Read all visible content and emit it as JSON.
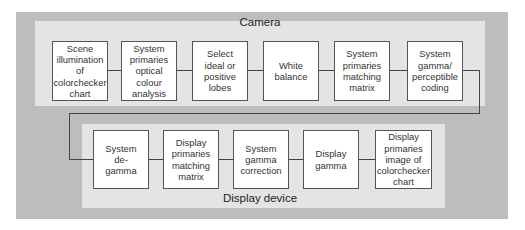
{
  "diagram": {
    "camera": {
      "title": "Camera",
      "boxes": [
        {
          "label": "Scene\nillumination\nof\ncolorchecker\nchart"
        },
        {
          "label": "System\nprimaries\noptical\ncolour\nanalysis"
        },
        {
          "label": "Select\nideal or\npositive\nlobes"
        },
        {
          "label": "White\nbalance"
        },
        {
          "label": "System\nprimaries\nmatching\nmatrix"
        },
        {
          "label": "System\ngamma/\nperceptible\ncoding"
        }
      ]
    },
    "display": {
      "title": "Display device",
      "boxes": [
        {
          "label": "System\nde-\ngamma"
        },
        {
          "label": "Display\nprimaries\nmatching\nmatrix"
        },
        {
          "label": "System\ngamma\ncorrection"
        },
        {
          "label": "Display\ngamma"
        },
        {
          "label": "Display\nprimaries\nimage of\ncolorchecker\nchart"
        }
      ]
    },
    "colors": {
      "outer_frame": "#bdbdbd",
      "panel": "#e4e4e4",
      "box": "#ffffff",
      "line": "#444444"
    }
  }
}
